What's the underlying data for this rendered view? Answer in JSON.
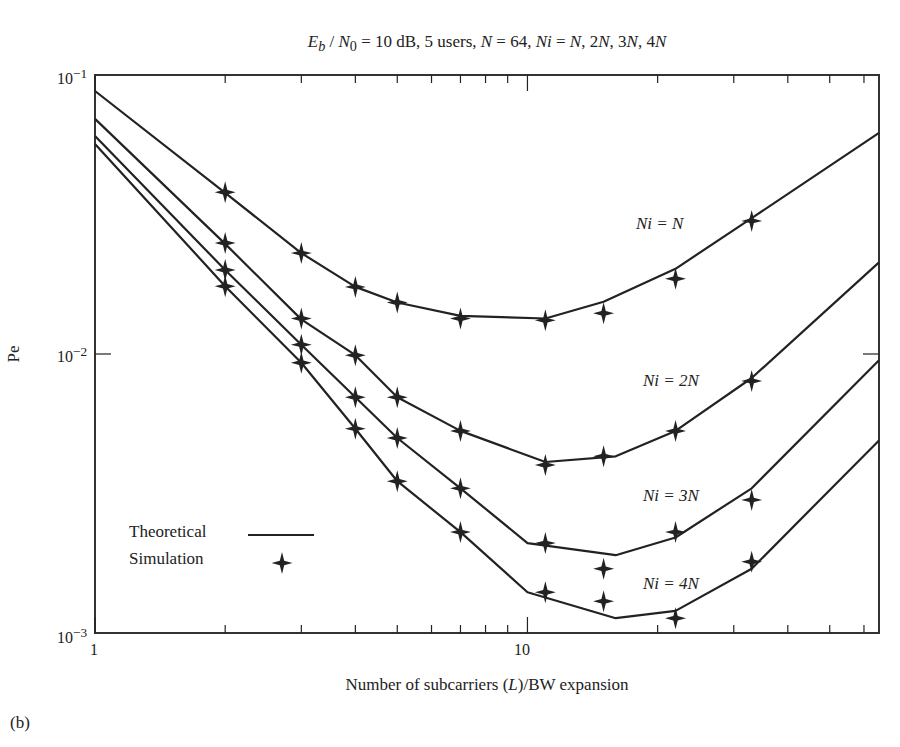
{
  "chart_data": {
    "type": "line",
    "title_parts": {
      "e": "E",
      "b": "b",
      "slash": " / ",
      "n": "N",
      "zero": "0",
      "rest1": " = 10 dB, 5 users, ",
      "n2": "N",
      "rest2": " = 64, ",
      "ni": "Ni",
      "rest3": " = ",
      "n3": "N",
      "sep1": ", 2",
      "n4": "N",
      "sep2": ", 3",
      "n5": "N",
      "sep3": ", 4",
      "n6": "N"
    },
    "xlabel": "Number of subcarriers (L)/BW expansion",
    "xlabel_parts": {
      "pre": "Number of subcarriers (",
      "l": "L",
      "post": ")/BW expansion"
    },
    "ylabel": "Pe",
    "xscale": "log",
    "yscale": "log",
    "xlim": [
      1,
      65
    ],
    "ylim": [
      0.001,
      0.1
    ],
    "xticks_major": [
      {
        "value": 1,
        "label": "1"
      },
      {
        "value": 10,
        "label": "10"
      }
    ],
    "xticks_minor": [
      2,
      3,
      4,
      5,
      6,
      7,
      8,
      9,
      20,
      30,
      40,
      50,
      60
    ],
    "yticks": [
      {
        "value": 0.1,
        "base": "10",
        "exp": "−1"
      },
      {
        "value": 0.01,
        "base": "10",
        "exp": "−2"
      },
      {
        "value": 0.001,
        "base": "10",
        "exp": "−3"
      }
    ],
    "grid": false,
    "panel_label": "(b)",
    "legend": {
      "position": "lower-left",
      "entries": [
        {
          "label": "Theoretical",
          "style": "line"
        },
        {
          "label": "Simulation",
          "style": "star-marker"
        }
      ]
    },
    "series": [
      {
        "name": "Ni = N",
        "label_pos": [
          636,
          225
        ],
        "theoretical": {
          "x": [
            1,
            2,
            3,
            4,
            5,
            7,
            11,
            15,
            22,
            33,
            65
          ],
          "y": [
            0.0876,
            0.0378,
            0.023,
            0.0174,
            0.0153,
            0.0137,
            0.0134,
            0.0154,
            0.0202,
            0.0307,
            0.062
          ]
        },
        "simulation": {
          "x": [
            2,
            3,
            4,
            5,
            7,
            11,
            15,
            22,
            33
          ],
          "y": [
            0.038,
            0.023,
            0.0174,
            0.0153,
            0.0134,
            0.0132,
            0.014,
            0.0186,
            0.03
          ]
        }
      },
      {
        "name": "Ni = 2N",
        "label_pos": [
          643,
          382
        ],
        "theoretical": {
          "x": [
            1,
            2,
            3,
            4,
            5,
            7,
            11,
            16,
            22,
            33,
            65
          ],
          "y": [
            0.0696,
            0.0248,
            0.0133,
            0.0099,
            0.007,
            0.0053,
            0.0041,
            0.0043,
            0.0053,
            0.0082,
            0.0213
          ]
        },
        "simulation": {
          "x": [
            2,
            3,
            4,
            5,
            7,
            11,
            15,
            22,
            33
          ],
          "y": [
            0.025,
            0.0134,
            0.0099,
            0.007,
            0.0053,
            0.004,
            0.0043,
            0.0053,
            0.008
          ]
        }
      },
      {
        "name": "Ni = 3N",
        "label_pos": [
          643,
          497
        ],
        "theoretical": {
          "x": [
            1,
            2,
            3,
            4,
            5,
            7,
            10,
            16,
            22,
            33,
            65
          ],
          "y": [
            0.0604,
            0.02,
            0.0108,
            0.007,
            0.005,
            0.0033,
            0.0021,
            0.0019,
            0.0022,
            0.0033,
            0.0095
          ]
        },
        "simulation": {
          "x": [
            2,
            3,
            4,
            5,
            7,
            11,
            15,
            22,
            33
          ],
          "y": [
            0.02,
            0.0108,
            0.007,
            0.005,
            0.0033,
            0.0021,
            0.0017,
            0.0023,
            0.003
          ]
        }
      },
      {
        "name": "Ni = 4N",
        "label_pos": [
          643,
          585
        ],
        "theoretical": {
          "x": [
            1,
            2,
            3,
            4,
            5,
            7,
            10,
            16,
            22,
            33,
            65
          ],
          "y": [
            0.0566,
            0.0175,
            0.0093,
            0.0054,
            0.0035,
            0.0023,
            0.0014,
            0.00113,
            0.0012,
            0.0017,
            0.0049
          ]
        },
        "simulation": {
          "x": [
            2,
            3,
            4,
            5,
            7,
            11,
            15,
            22,
            33
          ],
          "y": [
            0.0175,
            0.0093,
            0.0054,
            0.0035,
            0.0023,
            0.0014,
            0.0013,
            0.00113,
            0.0018
          ]
        }
      }
    ]
  },
  "style": {
    "line_color": "#222222",
    "frame_color": "#333333",
    "background": "#ffffff"
  }
}
